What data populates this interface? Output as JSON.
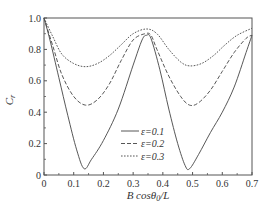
{
  "chart_data": {
    "type": "line",
    "title": "",
    "xlabel": "B cosθ0/L",
    "xlabel_parts": {
      "main": "B cosθ",
      "sub": "0",
      "tail": "/L"
    },
    "ylabel": "Cr",
    "ylabel_parts": {
      "main": "C",
      "sub": "r"
    },
    "xlim": [
      0,
      0.7
    ],
    "ylim": [
      0,
      1.0
    ],
    "xticks": [
      "0",
      "0.1",
      "0.2",
      "0.3",
      "0.4",
      "0.5",
      "0.6",
      "0.7"
    ],
    "yticks": [
      "0",
      "0.2",
      "0.4",
      "0.6",
      "0.8",
      "1.0"
    ],
    "legend_position": "lower-center",
    "grid": false,
    "series": [
      {
        "name": "ε=0.1",
        "style": "solid",
        "x": [
          0,
          0.02,
          0.05,
          0.08,
          0.11,
          0.135,
          0.16,
          0.2,
          0.25,
          0.3,
          0.33,
          0.345,
          0.36,
          0.39,
          0.42,
          0.45,
          0.475,
          0.49,
          0.52,
          0.56,
          0.6,
          0.64,
          0.68,
          0.7
        ],
        "y": [
          1.0,
          0.86,
          0.62,
          0.38,
          0.16,
          0.04,
          0.1,
          0.22,
          0.42,
          0.7,
          0.86,
          0.89,
          0.87,
          0.67,
          0.42,
          0.2,
          0.06,
          0.04,
          0.13,
          0.27,
          0.4,
          0.56,
          0.78,
          0.89
        ]
      },
      {
        "name": "ε=0.2",
        "style": "dashed",
        "x": [
          0,
          0.03,
          0.06,
          0.1,
          0.14,
          0.18,
          0.22,
          0.26,
          0.3,
          0.34,
          0.36,
          0.38,
          0.42,
          0.46,
          0.49,
          0.52,
          0.56,
          0.6,
          0.64,
          0.68,
          0.7
        ],
        "y": [
          1.0,
          0.82,
          0.64,
          0.5,
          0.445,
          0.48,
          0.58,
          0.73,
          0.86,
          0.9,
          0.89,
          0.8,
          0.63,
          0.5,
          0.445,
          0.46,
          0.54,
          0.66,
          0.78,
          0.87,
          0.89
        ]
      },
      {
        "name": "ε=0.3",
        "style": "dotted",
        "x": [
          0,
          0.03,
          0.06,
          0.1,
          0.14,
          0.18,
          0.22,
          0.26,
          0.3,
          0.345,
          0.38,
          0.42,
          0.46,
          0.49,
          0.53,
          0.57,
          0.61,
          0.65,
          0.7
        ],
        "y": [
          1.0,
          0.88,
          0.77,
          0.71,
          0.69,
          0.71,
          0.76,
          0.83,
          0.9,
          0.93,
          0.9,
          0.8,
          0.72,
          0.695,
          0.71,
          0.76,
          0.83,
          0.89,
          0.935
        ]
      }
    ]
  }
}
